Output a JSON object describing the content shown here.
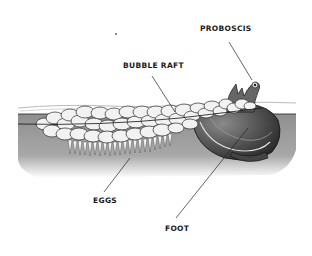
{
  "diagram": {
    "labels": {
      "proboscis": "PROBOSCIS",
      "bubble_raft": "BUBBLE RAFT",
      "eggs": "EGGS",
      "foot": "FOOT"
    },
    "colors": {
      "background": "#ffffff",
      "water": "#9a9a9a",
      "water_light": "#d6d6d6",
      "bubble_fill": "#f2f2f2",
      "bubble_stroke": "#2a2a2a",
      "shell_dark": "#3a3a3a",
      "shell_mid": "#6d6d6d",
      "line": "#222222"
    }
  }
}
